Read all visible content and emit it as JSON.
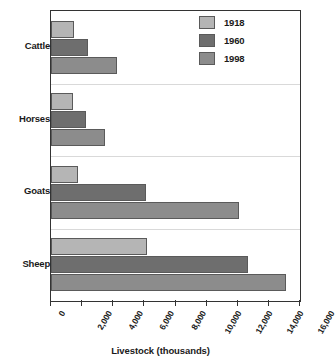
{
  "chart_data": {
    "type": "bar",
    "orientation": "horizontal",
    "title": "",
    "xlabel": "Livestock (thousands)",
    "ylabel": "",
    "xlim": [
      0,
      16000
    ],
    "xticks": [
      0,
      2000,
      4000,
      6000,
      8000,
      10000,
      12000,
      14000,
      16000
    ],
    "xtick_labels": [
      "0",
      "2,000",
      "4,000",
      "6,000",
      "8,000",
      "10,000",
      "12,000",
      "14,000",
      "16,000"
    ],
    "categories": [
      "Cattle",
      "Horses",
      "Goats",
      "Sheep"
    ],
    "grid": false,
    "legend_position": "top-right",
    "series": [
      {
        "name": "1918",
        "color": "#b5b5b5",
        "values": [
          1500,
          1400,
          1750,
          6200
        ]
      },
      {
        "name": "1960",
        "color": "#6e6e6e",
        "values": [
          2400,
          2250,
          6100,
          12650
        ]
      },
      {
        "name": "1998",
        "color": "#8c8c8c",
        "values": [
          4250,
          3500,
          12100,
          15100
        ]
      }
    ]
  },
  "legend": {
    "entries": [
      {
        "label": "1918",
        "color": "#b5b5b5"
      },
      {
        "label": "1960",
        "color": "#6e6e6e"
      },
      {
        "label": "1998",
        "color": "#8c8c8c"
      }
    ]
  },
  "axis": {
    "x_title": "Livestock (thousands)"
  }
}
